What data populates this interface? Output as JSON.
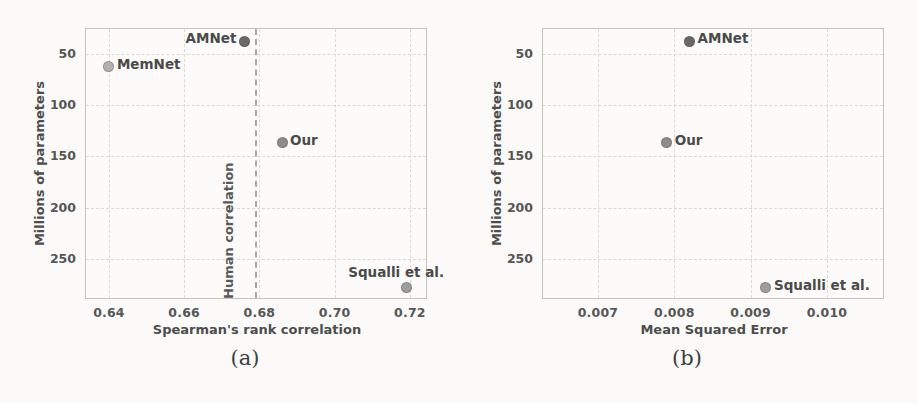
{
  "captions": {
    "a": "(a)",
    "b": "(b)"
  },
  "colors": {
    "page_background": "#fbfaf8",
    "plot_border": "#c6c2bd",
    "grid": "#ded8d1",
    "tick_text": "#565656",
    "axis_label_text": "#4d4d4d",
    "point_label_text": "#4a4a4a",
    "human_correlation_line": "#a9a7a3"
  },
  "chart_data": [
    {
      "id": "a",
      "type": "scatter",
      "title": "",
      "xlabel": "Spearman's rank correlation",
      "ylabel": "Millions of parameters",
      "xlim": [
        0.6339,
        0.7248
      ],
      "ylim": [
        26,
        290
      ],
      "y_inverted": true,
      "grid": true,
      "xticks": [
        0.64,
        0.66,
        0.68,
        0.7,
        0.72
      ],
      "xtick_labels": [
        "0.64",
        "0.66",
        "0.68",
        "0.70",
        "0.72"
      ],
      "yticks": [
        50,
        100,
        150,
        200,
        250
      ],
      "ytick_labels": [
        "50",
        "100",
        "150",
        "200",
        "250"
      ],
      "points": [
        {
          "label": "AMNet",
          "x": 0.676,
          "y": 38,
          "color": "#696969",
          "label_side": "left"
        },
        {
          "label": "MemNet",
          "x": 0.64,
          "y": 63,
          "color": "#b2b2b2",
          "label_side": "right"
        },
        {
          "label": "Our",
          "x": 0.686,
          "y": 137,
          "color": "#8c8c8c",
          "label_side": "right"
        },
        {
          "label": "Squalli et al.",
          "x": 0.719,
          "y": 278,
          "color": "#9d9d9d",
          "label_side": "above"
        }
      ],
      "vline": {
        "x": 0.679,
        "label": "Human correlation"
      }
    },
    {
      "id": "b",
      "type": "scatter",
      "title": "",
      "xlabel": "Mean Squared Error",
      "ylabel": "Millions of parameters",
      "xlim": [
        0.00628,
        0.01076
      ],
      "ylim": [
        26,
        290
      ],
      "y_inverted": true,
      "grid": true,
      "xticks": [
        0.007,
        0.008,
        0.009,
        0.01
      ],
      "xtick_labels": [
        "0.007",
        "0.008",
        "0.009",
        "0.010"
      ],
      "yticks": [
        50,
        100,
        150,
        200,
        250
      ],
      "ytick_labels": [
        "50",
        "100",
        "150",
        "200",
        "250"
      ],
      "points": [
        {
          "label": "AMNet",
          "x": 0.0082,
          "y": 38,
          "color": "#696969",
          "label_side": "right"
        },
        {
          "label": "Our",
          "x": 0.0079,
          "y": 137,
          "color": "#8c8c8c",
          "label_side": "right"
        },
        {
          "label": "Squalli et al.",
          "x": 0.0092,
          "y": 278,
          "color": "#9d9d9d",
          "label_side": "right"
        }
      ]
    }
  ]
}
